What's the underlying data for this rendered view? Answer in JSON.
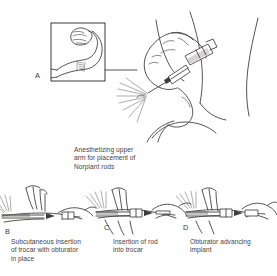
{
  "figure": {
    "background_color": "#ffffff",
    "ink_color": "#3f3d3a",
    "panels": [
      {
        "letter": "A",
        "name": "inset-arm-diagram",
        "caption": "",
        "description": "Inset box showing flexed upper arm with insertion site marking"
      },
      {
        "letter": "",
        "name": "main-anesthetizing-scene",
        "caption": "Anesthetizing upper\narm for placement of\nNorplant rods",
        "description": "Gloved hand holding syringe injecting local anesthetic into upper arm"
      },
      {
        "letter": "B",
        "name": "trocar-insertion-scene",
        "caption": "Subcutaneous insertion\nof trocar with obturator\nin place",
        "description": "Trocar with obturator being inserted subcutaneously into the arm"
      },
      {
        "letter": "C",
        "name": "rod-insertion-scene",
        "caption": "Insertion of rod\ninto trocar",
        "description": "Norplant rod being loaded into the trocar barrel"
      },
      {
        "letter": "D",
        "name": "obturator-advancing-scene",
        "caption": "Obturator advancing\nimplant",
        "description": "Obturator pushing the implant rod into position under the skin"
      }
    ]
  }
}
